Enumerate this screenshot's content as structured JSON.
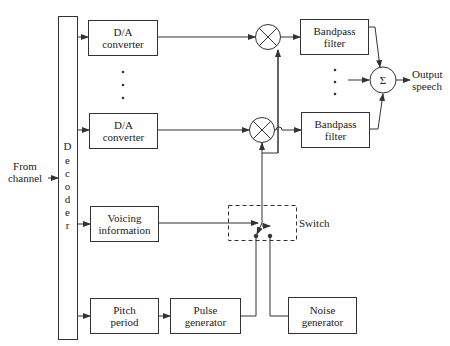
{
  "diagram": {
    "type": "block-diagram",
    "input": {
      "label_line1": "From",
      "label_line2": "channel"
    },
    "decoder": {
      "label": "Decoder",
      "letters": [
        "D",
        "e",
        "c",
        "o",
        "d",
        "e",
        "r"
      ]
    },
    "da_converters": [
      {
        "line1": "D/A",
        "line2": "converter"
      },
      {
        "line1": "D/A",
        "line2": "converter"
      }
    ],
    "ellipsis_left": "⋮",
    "multipliers": [
      {
        "symbol": "⊗"
      },
      {
        "symbol": "⊗"
      }
    ],
    "bandpass_filters": [
      {
        "line1": "Bandpass",
        "line2": "filter"
      },
      {
        "line1": "Bandpass",
        "line2": "filter"
      }
    ],
    "ellipsis_right": "⋮",
    "summer": {
      "symbol": "Σ"
    },
    "output": {
      "line1": "Output",
      "line2": "speech"
    },
    "voicing": {
      "line1": "Voicing",
      "line2": "information"
    },
    "switch": {
      "label": "Switch"
    },
    "pitch_period": {
      "line1": "Pitch",
      "line2": "period"
    },
    "pulse_generator": {
      "line1": "Pulse",
      "line2": "generator"
    },
    "noise_generator": {
      "line1": "Noise",
      "line2": "generator"
    },
    "colors": {
      "line": "#333333",
      "background": "#ffffff"
    }
  }
}
